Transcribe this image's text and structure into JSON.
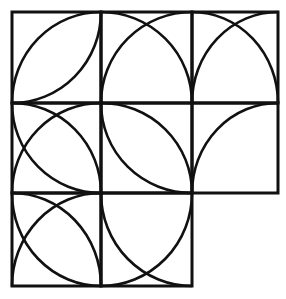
{
  "diagram": {
    "title": "",
    "type": "quarter-circle tile pattern",
    "stroke_color": "#111111",
    "background": "#ffffff",
    "grid": {
      "origin_x": 12,
      "origin_y": 12,
      "col_edges": [
        12,
        101,
        192,
        278
      ],
      "row_edges": [
        12,
        103,
        193,
        286
      ],
      "cells": [
        {
          "row": 0,
          "col": 0,
          "arc_centers": [
            "TL",
            "BR"
          ]
        },
        {
          "row": 0,
          "col": 1,
          "arc_centers": [
            "BL",
            "BR"
          ]
        },
        {
          "row": 0,
          "col": 2,
          "arc_centers": [
            "BL",
            "BR"
          ]
        },
        {
          "row": 1,
          "col": 0,
          "arc_centers": [
            "BL",
            "BR",
            "TR"
          ]
        },
        {
          "row": 1,
          "col": 1,
          "arc_centers": [
            "TR",
            "BL"
          ]
        },
        {
          "row": 1,
          "col": 2,
          "arc_centers": [
            "BR"
          ]
        },
        {
          "row": 2,
          "col": 0,
          "arc_centers": [
            "BL",
            "BR",
            "TR"
          ]
        },
        {
          "row": 2,
          "col": 1,
          "arc_centers": [
            "TR",
            "TL"
          ]
        }
      ]
    }
  }
}
